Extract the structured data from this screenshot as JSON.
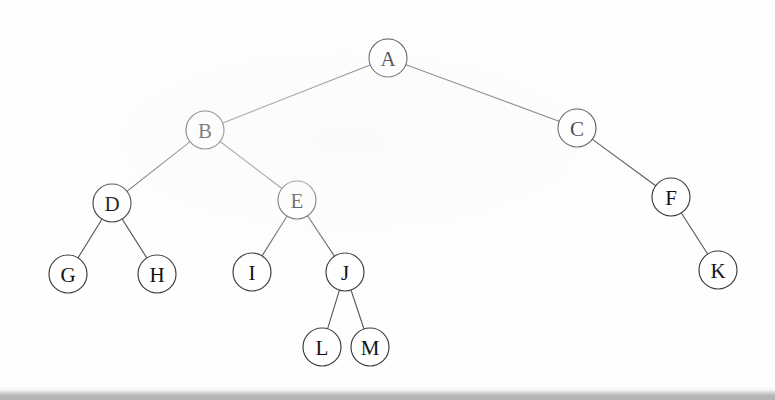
{
  "figure": {
    "caption": "",
    "background_color": "#fefefe",
    "node_fill_color": "#ffffff",
    "node_stroke_color": "#3c3c3c",
    "edge_color": "#5a5a5a",
    "label_color": "#111111",
    "node_radius": 19,
    "bottom_band_color": "#b4b4b4"
  },
  "tree": {
    "root": "A",
    "node_count": 13,
    "nodes": [
      {
        "id": "A",
        "label": "A",
        "x": 388,
        "y": 58,
        "level": 0
      },
      {
        "id": "B",
        "label": "B",
        "x": 205,
        "y": 130,
        "level": 1
      },
      {
        "id": "C",
        "label": "C",
        "x": 577,
        "y": 128,
        "level": 1
      },
      {
        "id": "D",
        "label": "D",
        "x": 112,
        "y": 203,
        "level": 2
      },
      {
        "id": "E",
        "label": "E",
        "x": 297,
        "y": 200,
        "level": 2
      },
      {
        "id": "F",
        "label": "F",
        "x": 671,
        "y": 197,
        "level": 2
      },
      {
        "id": "G",
        "label": "G",
        "x": 68,
        "y": 274,
        "level": 3
      },
      {
        "id": "H",
        "label": "H",
        "x": 157,
        "y": 274,
        "level": 3
      },
      {
        "id": "I",
        "label": "I",
        "x": 252,
        "y": 272,
        "level": 3
      },
      {
        "id": "J",
        "label": "J",
        "x": 345,
        "y": 272,
        "level": 3
      },
      {
        "id": "K",
        "label": "K",
        "x": 718,
        "y": 270,
        "level": 3
      },
      {
        "id": "L",
        "label": "L",
        "x": 322,
        "y": 347,
        "level": 4
      },
      {
        "id": "M",
        "label": "M",
        "x": 370,
        "y": 347,
        "level": 4
      }
    ],
    "edges": [
      {
        "from": "A",
        "to": "B",
        "side": "left"
      },
      {
        "from": "A",
        "to": "C",
        "side": "right"
      },
      {
        "from": "B",
        "to": "D",
        "side": "left"
      },
      {
        "from": "B",
        "to": "E",
        "side": "right"
      },
      {
        "from": "C",
        "to": "F",
        "side": "right"
      },
      {
        "from": "D",
        "to": "G",
        "side": "left"
      },
      {
        "from": "D",
        "to": "H",
        "side": "right"
      },
      {
        "from": "E",
        "to": "I",
        "side": "left"
      },
      {
        "from": "E",
        "to": "J",
        "side": "right"
      },
      {
        "from": "F",
        "to": "K",
        "side": "right"
      },
      {
        "from": "J",
        "to": "L",
        "side": "left"
      },
      {
        "from": "J",
        "to": "M",
        "side": "right"
      }
    ]
  }
}
